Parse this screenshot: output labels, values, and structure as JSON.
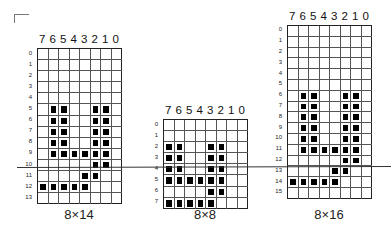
{
  "glyphs": [
    {
      "caption": "8×14",
      "cols": [
        "7",
        "6",
        "5",
        "4",
        "3",
        "2",
        "1",
        "0"
      ],
      "rows": 14,
      "x": 37,
      "y": 48,
      "cell_w": 10.5,
      "cell_h": 11.1,
      "filled": [
        [
          5,
          1
        ],
        [
          5,
          2
        ],
        [
          5,
          5
        ],
        [
          5,
          6
        ],
        [
          6,
          1
        ],
        [
          6,
          2
        ],
        [
          6,
          5
        ],
        [
          6,
          6
        ],
        [
          7,
          1
        ],
        [
          7,
          2
        ],
        [
          7,
          5
        ],
        [
          7,
          6
        ],
        [
          8,
          1
        ],
        [
          8,
          2
        ],
        [
          8,
          5
        ],
        [
          8,
          6
        ],
        [
          9,
          1
        ],
        [
          9,
          2
        ],
        [
          9,
          3
        ],
        [
          9,
          4
        ],
        [
          9,
          5
        ],
        [
          9,
          6
        ],
        [
          10,
          5
        ],
        [
          10,
          6
        ],
        [
          11,
          4
        ],
        [
          11,
          5
        ],
        [
          12,
          0
        ],
        [
          12,
          1
        ],
        [
          12,
          2
        ],
        [
          12,
          3
        ],
        [
          12,
          4
        ]
      ]
    },
    {
      "caption": "8×8",
      "cols": [
        "7",
        "6",
        "5",
        "4",
        "3",
        "2",
        "1",
        "0"
      ],
      "rows": 8,
      "x": 163,
      "y": 119,
      "cell_w": 10.5,
      "cell_h": 11.1,
      "filled": [
        [
          2,
          0
        ],
        [
          2,
          1
        ],
        [
          2,
          4
        ],
        [
          2,
          5
        ],
        [
          3,
          0
        ],
        [
          3,
          1
        ],
        [
          3,
          4
        ],
        [
          3,
          5
        ],
        [
          4,
          0
        ],
        [
          4,
          1
        ],
        [
          4,
          4
        ],
        [
          4,
          5
        ],
        [
          5,
          0
        ],
        [
          5,
          1
        ],
        [
          5,
          2
        ],
        [
          5,
          3
        ],
        [
          5,
          4
        ],
        [
          5,
          5
        ],
        [
          6,
          4
        ],
        [
          6,
          5
        ],
        [
          7,
          0
        ],
        [
          7,
          1
        ],
        [
          7,
          2
        ],
        [
          7,
          3
        ],
        [
          7,
          4
        ]
      ]
    },
    {
      "caption": "8×16",
      "cols": [
        "7",
        "6",
        "5",
        "4",
        "3",
        "2",
        "1",
        "0"
      ],
      "rows": 16,
      "x": 287,
      "y": 25,
      "cell_w": 10.5,
      "cell_h": 10.8,
      "filled": [
        [
          6,
          1
        ],
        [
          6,
          2
        ],
        [
          6,
          5
        ],
        [
          6,
          6
        ],
        [
          7,
          1
        ],
        [
          7,
          2
        ],
        [
          7,
          5
        ],
        [
          7,
          6
        ],
        [
          8,
          1
        ],
        [
          8,
          2
        ],
        [
          8,
          5
        ],
        [
          8,
          6
        ],
        [
          9,
          1
        ],
        [
          9,
          2
        ],
        [
          9,
          5
        ],
        [
          9,
          6
        ],
        [
          10,
          1
        ],
        [
          10,
          2
        ],
        [
          10,
          5
        ],
        [
          10,
          6
        ],
        [
          11,
          1
        ],
        [
          11,
          2
        ],
        [
          11,
          3
        ],
        [
          11,
          4
        ],
        [
          11,
          5
        ],
        [
          11,
          6
        ],
        [
          12,
          5
        ],
        [
          12,
          6
        ],
        [
          13,
          4
        ],
        [
          13,
          5
        ],
        [
          14,
          0
        ],
        [
          14,
          1
        ],
        [
          14,
          2
        ],
        [
          14,
          3
        ],
        [
          14,
          4
        ]
      ]
    }
  ]
}
